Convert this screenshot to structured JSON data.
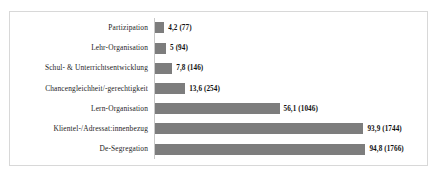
{
  "chart_data": {
    "type": "bar",
    "orientation": "horizontal",
    "title": "",
    "subtitle": "",
    "xlabel": "",
    "ylabel": "",
    "xlim": [
      0,
      100
    ],
    "grid": false,
    "legend": null,
    "bar_color": "#7d7d7d",
    "frame_color": "#d8d8d8",
    "axis_color": "#c9c9c9",
    "categories": [
      "Partizipation",
      "Lehr-Organisation",
      "Schul- & Unterrichtsentwicklung",
      "Chancengleichheit/-gerechtigkeit",
      "Lern-Organisation",
      "Klientel-/Adressat:innenbezug",
      "De-Segregation"
    ],
    "values": [
      4.2,
      5,
      7.8,
      13.6,
      56.1,
      93.9,
      94.8
    ],
    "counts": [
      77,
      94,
      146,
      254,
      1046,
      1744,
      1766
    ],
    "data_labels": [
      "4,2 (77)",
      "5 (94)",
      "7,8 (146)",
      "13,6 (254)",
      "56,1 (1046)",
      "93,9 (1744)",
      "94,8 (1766)"
    ]
  }
}
